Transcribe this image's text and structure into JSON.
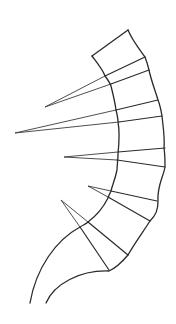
{
  "figure": {
    "stroke_color": "#2a2a2a",
    "background": "#ffffff",
    "outline": {
      "left_border": "M92,56 C98,64 103,70 105,76 C108,80 110,83 111,86 C113,94 115,102 116,110 C117,114 118,118 118,122 C120,132 119,144 118,154 C118,160 117,166 117,170 C115,180 112,186 111,191 C110,193 109,195 108,198 C103,208 96,216 88,222 C86,224 83,225 80,227 C56,240 36,268 30,303",
      "right_border": "M128,30 C132,40 140,50 145,57 C147,62 148,66 149,70 C151,80 155,90 158,100 C160,105 161,110 162,116 C163,126 165,138 164,148 C165,154 165,160 165,167 C163,178 157,186 158,201 C158,210 156,215 150,221 C143,232 134,244 128,255 C122,262 116,268 109,271 C80,270 54,284 46,303",
      "top_edge": "M92,56 L128,30"
    },
    "cross_lines": [
      {
        "x1": 105,
        "y1": 76,
        "x2": 145,
        "y2": 57
      },
      {
        "x1": 111,
        "y1": 84,
        "x2": 149,
        "y2": 70
      },
      {
        "x1": 116,
        "y1": 110,
        "x2": 158,
        "y2": 100
      },
      {
        "x1": 119,
        "y1": 122,
        "x2": 162,
        "y2": 116
      },
      {
        "x1": 118,
        "y1": 152,
        "x2": 165,
        "y2": 148
      },
      {
        "x1": 117,
        "y1": 160,
        "x2": 165,
        "y2": 167
      },
      {
        "x1": 111,
        "y1": 191,
        "x2": 157,
        "y2": 201
      },
      {
        "x1": 108,
        "y1": 197,
        "x2": 150,
        "y2": 221
      },
      {
        "x1": 88,
        "y1": 222,
        "x2": 128,
        "y2": 255
      },
      {
        "x1": 80,
        "y1": 227,
        "x2": 109,
        "y2": 270
      }
    ],
    "spikes": [
      {
        "tip": [
          45,
          107
        ],
        "a": [
          105,
          76
        ],
        "b": [
          111,
          84
        ]
      },
      {
        "tip": [
          15,
          133
        ],
        "a": [
          116,
          110
        ],
        "b": [
          119,
          122
        ]
      },
      {
        "tip": [
          64,
          157
        ],
        "a": [
          118,
          152
        ],
        "b": [
          117,
          160
        ]
      },
      {
        "tip": [
          88,
          186
        ],
        "a": [
          111,
          191
        ],
        "b": [
          108,
          197
        ]
      },
      {
        "tip": [
          61,
          200
        ],
        "a": [
          88,
          222
        ],
        "b": [
          80,
          227
        ]
      }
    ]
  }
}
